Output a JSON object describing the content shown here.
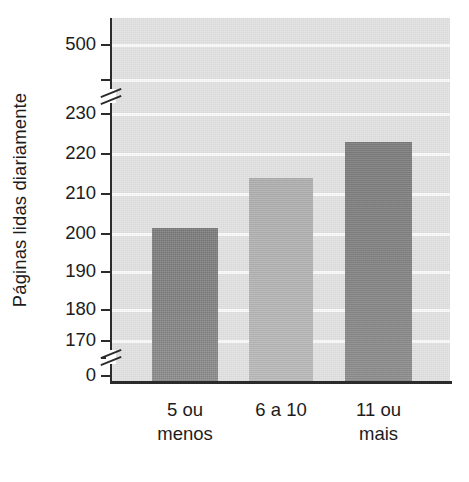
{
  "chart_data": {
    "type": "bar",
    "title": "",
    "subtitle": "",
    "xlabel": "",
    "ylabel": "Páginas lidas diariamente",
    "categories": [
      "5 ou\nmenos",
      "6 a 10",
      "11 ou\nmais"
    ],
    "category_lines": [
      {
        "line1": "5 ou",
        "line2": "menos"
      },
      {
        "line1": "6 a 10",
        "line2": ""
      },
      {
        "line1": "11 ou",
        "line2": "mais"
      }
    ],
    "values": [
      197,
      214,
      223
    ],
    "bar_colors": [
      "#828282",
      "#b6b6b6",
      "#828282"
    ],
    "y_tick_labels": [
      "500",
      "230",
      "220",
      "210",
      "200",
      "190",
      "180",
      "170",
      "0"
    ],
    "y_tick_values": [
      500,
      230,
      220,
      210,
      200,
      190,
      180,
      170,
      0
    ],
    "ylim": [
      0,
      500
    ],
    "axis_breaks": [
      {
        "between": "500-230"
      },
      {
        "between": "170-0"
      }
    ],
    "grid": true,
    "grid_color": "#fbfbfb",
    "plot_background": "#e3e3e3",
    "legend": "none",
    "orientation": "vertical"
  },
  "axes": {
    "y_title": "Páginas lidas diariamente",
    "ticks": [
      {
        "label": "500",
        "y": 44
      },
      {
        "label": "230",
        "y": 113
      },
      {
        "label": "220",
        "y": 153
      },
      {
        "label": "210",
        "y": 193
      },
      {
        "label": "200",
        "y": 233
      },
      {
        "label": "190",
        "y": 271
      },
      {
        "label": "180",
        "y": 309
      },
      {
        "label": "170",
        "y": 340
      },
      {
        "label": "0",
        "y": 375
      }
    ]
  },
  "bars": [
    {
      "name": "bar-5-ou-menos",
      "label_line1": "5 ou",
      "label_line2": "menos",
      "value": 197,
      "color": "#828282",
      "left": 40,
      "width": 66,
      "top": 228
    },
    {
      "name": "bar-6-a-10",
      "label_line1": "6 a 10",
      "label_line2": "",
      "value": 214,
      "color": "#b6b6b6",
      "left": 137,
      "width": 64,
      "top": 178
    },
    {
      "name": "bar-11-ou-mais",
      "label_line1": "11 ou",
      "label_line2": "mais",
      "value": 223,
      "color": "#828282",
      "left": 233,
      "width": 67,
      "top": 142
    }
  ],
  "gridlines_y": [
    44,
    79,
    113,
    153,
    193,
    233,
    271,
    309,
    340
  ]
}
